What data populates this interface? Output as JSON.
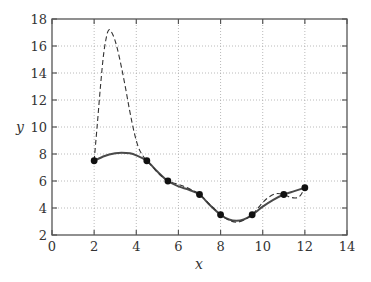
{
  "chart_data": {
    "type": "line",
    "title": "",
    "xlabel": "x",
    "ylabel": "y",
    "xlim": [
      0,
      14
    ],
    "ylim": [
      2,
      18
    ],
    "xticks": [
      0,
      2,
      4,
      6,
      8,
      10,
      12,
      14
    ],
    "yticks": [
      2,
      4,
      6,
      8,
      10,
      12,
      14,
      16,
      18
    ],
    "xtick_labels": [
      "0",
      "2",
      "4",
      "6",
      "8",
      "10",
      "12",
      "14"
    ],
    "ytick_labels": [
      "2",
      "4",
      "6",
      "8",
      "10",
      "12",
      "14",
      "16",
      "18"
    ],
    "grid": true,
    "legend": null,
    "series": [
      {
        "name": "data points",
        "style": "markers",
        "x": [
          2,
          4.5,
          5.5,
          7,
          8,
          9.5,
          11,
          12
        ],
        "y": [
          7.5,
          7.5,
          6.0,
          5.0,
          3.5,
          3.5,
          5.0,
          5.5
        ]
      },
      {
        "name": "smooth interpolant (solid)",
        "style": "solid",
        "x": [
          2,
          2.5,
          3,
          3.3,
          3.7,
          4,
          4.5,
          5,
          5.5,
          6,
          6.5,
          7,
          7.5,
          8,
          8.4,
          8.75,
          9.1,
          9.5,
          10,
          10.5,
          11,
          11.5,
          12
        ],
        "y": [
          7.5,
          7.85,
          8.05,
          8.1,
          8.05,
          7.9,
          7.5,
          6.7,
          6.0,
          5.6,
          5.35,
          5.0,
          4.2,
          3.5,
          3.15,
          3.05,
          3.15,
          3.5,
          4.1,
          4.6,
          5.0,
          5.25,
          5.5
        ]
      },
      {
        "name": "polynomial interpolant (dashed)",
        "style": "dashed",
        "x": [
          2,
          2.15,
          2.3,
          2.45,
          2.6,
          2.7,
          2.8,
          2.95,
          3.1,
          3.3,
          3.5,
          3.7,
          3.9,
          4.1,
          4.3,
          4.5,
          4.8,
          5.1,
          5.5,
          6.0,
          6.5,
          7,
          7.5,
          8,
          8.4,
          8.75,
          9.1,
          9.5,
          9.8,
          10.2,
          10.6,
          11,
          11.3,
          11.6,
          11.8,
          12
        ],
        "y": [
          7.5,
          10.2,
          13.0,
          15.4,
          16.8,
          17.2,
          17.1,
          16.6,
          15.8,
          14.4,
          12.8,
          11.1,
          9.6,
          8.5,
          7.9,
          7.5,
          7.0,
          6.5,
          6.0,
          5.75,
          5.45,
          5.0,
          4.25,
          3.5,
          3.1,
          2.95,
          3.1,
          3.5,
          4.05,
          4.7,
          5.05,
          5.0,
          4.8,
          4.75,
          4.95,
          5.5
        ]
      }
    ]
  }
}
